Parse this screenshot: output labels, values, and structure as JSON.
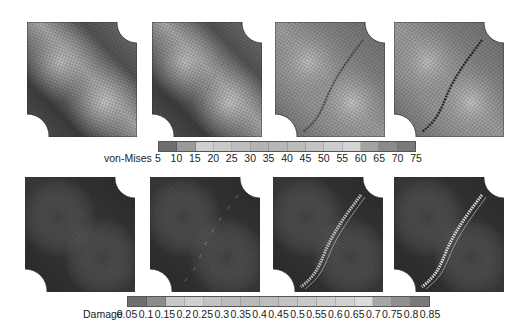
{
  "figure": {
    "rows": [
      {
        "field": "von-Mises",
        "panels": [
          {
            "id": "vm-1",
            "state": "smooth stress band, no crack",
            "crack": false
          },
          {
            "id": "vm-2",
            "state": "stress band with faint localization",
            "crack": "faint"
          },
          {
            "id": "vm-3",
            "state": "crack forming between holes",
            "crack": "partial"
          },
          {
            "id": "vm-4",
            "state": "crack fully propagated",
            "crack": "full"
          }
        ]
      },
      {
        "field": "Damage",
        "panels": [
          {
            "id": "dmg-1",
            "state": "no damage",
            "crack": false
          },
          {
            "id": "dmg-2",
            "state": "damage initiation near holes",
            "crack": "faint"
          },
          {
            "id": "dmg-3",
            "state": "damage band between holes",
            "crack": "partial"
          },
          {
            "id": "dmg-4",
            "state": "full damage band",
            "crack": "full"
          }
        ]
      }
    ]
  },
  "colorbars": {
    "vonmises": {
      "title": "von-Mises",
      "ticks": [
        "5",
        "10",
        "15",
        "20",
        "25",
        "30",
        "35",
        "40",
        "45",
        "50",
        "55",
        "60",
        "65",
        "70",
        "75"
      ],
      "colors": [
        "#6e6e6e",
        "#9a9a9a",
        "#cfcfcf",
        "#c9c9c9",
        "#bdbdbd",
        "#b3b3b3",
        "#b7b7b7",
        "#bcbcbc",
        "#c4c4c4",
        "#cdcdcd",
        "#d4d4d4",
        "#a3a3a3",
        "#8a8a8a",
        "#7a7a7a"
      ]
    },
    "damage": {
      "title": "Damage",
      "ticks": [
        "0.05",
        "0.1",
        "0.15",
        "0.2",
        "0.25",
        "0.3",
        "0.35",
        "0.4",
        "0.45",
        "0.5",
        "0.55",
        "0.6",
        "0.65",
        "0.7",
        "0.75",
        "0.8",
        "0.85"
      ],
      "colors": [
        "#6f6f6f",
        "#8c8c8c",
        "#c7c7c7",
        "#cfcfcf",
        "#c3c3c3",
        "#bbbbbb",
        "#b9b9b9",
        "#bdbdbd",
        "#c2c2c2",
        "#c8c8c8",
        "#cdcdcd",
        "#d2d2d2",
        "#dadada",
        "#a6a6a6",
        "#8f8f8f",
        "#7a7a7a"
      ]
    }
  },
  "chart_data": {
    "type": "heatmap",
    "title": "",
    "panels": [
      {
        "row": 1,
        "field": "von-Mises",
        "count": 4
      },
      {
        "row": 2,
        "field": "Damage",
        "count": 4
      }
    ],
    "colorbars": [
      {
        "label": "von-Mises",
        "range": [
          5,
          75
        ],
        "ticks": [
          5,
          10,
          15,
          20,
          25,
          30,
          35,
          40,
          45,
          50,
          55,
          60,
          65,
          70,
          75
        ]
      },
      {
        "label": "Damage",
        "range": [
          0.05,
          0.85
        ],
        "ticks": [
          0.05,
          0.1,
          0.15,
          0.2,
          0.25,
          0.3,
          0.35,
          0.4,
          0.45,
          0.5,
          0.55,
          0.6,
          0.65,
          0.7,
          0.75,
          0.8,
          0.85
        ]
      }
    ]
  }
}
